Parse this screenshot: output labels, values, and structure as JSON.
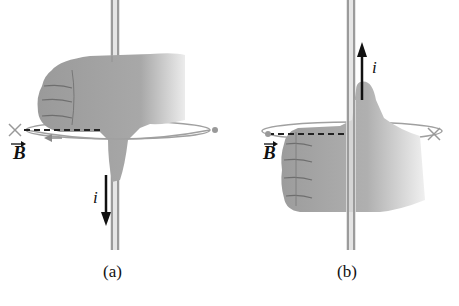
{
  "figure": {
    "panels": [
      {
        "id": "a",
        "label": "(a)",
        "current_label": "i",
        "current_direction": "down",
        "field_label": "B",
        "field_vector_marker": "→",
        "field_left_symbol": "×",
        "field_right_symbol": "•",
        "circulation_direction": "counterclockwise-from-above"
      },
      {
        "id": "b",
        "label": "(b)",
        "current_label": "i",
        "current_direction": "up",
        "field_label": "B",
        "field_vector_marker": "→",
        "field_left_symbol": "•",
        "field_right_symbol": "×",
        "circulation_direction": "clockwise-from-above"
      }
    ],
    "colors": {
      "hand": "#a9a9a9",
      "hand_shadow": "#8c8c8c",
      "wire": "#bdbdbd",
      "loop": "#9a9a9a",
      "arrow": "#111111",
      "background": "#ffffff"
    }
  }
}
